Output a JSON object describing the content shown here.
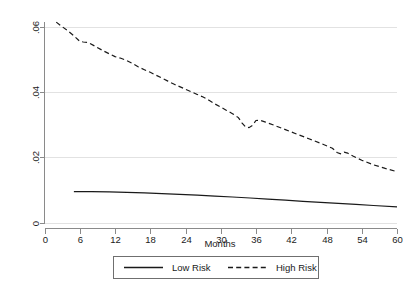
{
  "chart_data": {
    "type": "line",
    "title": "",
    "subtitle": "",
    "xlabel": "Months",
    "ylabel": "",
    "xlim": [
      0,
      60
    ],
    "ylim": [
      0,
      0.065
    ],
    "grid": true,
    "grid_orientation": "horizontal",
    "legend_position": "bottom-center",
    "background_color": "#ffffff",
    "gridline_color": "#e2e2e2",
    "axis_color": "#8a8a8a",
    "series_color": "#1a1a1a",
    "x_ticks": [
      0,
      6,
      12,
      18,
      24,
      30,
      36,
      42,
      48,
      54,
      60
    ],
    "x_tick_labels": [
      "0",
      "6",
      "12",
      "18",
      "24",
      "30",
      "36",
      "42",
      "48",
      "54",
      "60"
    ],
    "y_ticks": [
      0,
      0.02,
      0.04,
      0.06
    ],
    "y_tick_labels": [
      "0",
      ".02",
      ".04",
      ".06"
    ],
    "series": [
      {
        "name": "Low Risk",
        "style": "solid",
        "x": [
          5,
          8,
          11,
          14,
          17,
          20,
          23,
          26,
          29,
          32,
          35,
          38,
          41,
          44,
          47,
          50,
          53,
          56,
          60
        ],
        "values": [
          0.0095,
          0.00945,
          0.0094,
          0.00925,
          0.0091,
          0.00888,
          0.00865,
          0.0084,
          0.00812,
          0.00783,
          0.00752,
          0.00718,
          0.00685,
          0.0065,
          0.00618,
          0.00588,
          0.00558,
          0.00522,
          0.00482
        ]
      },
      {
        "name": "High Risk",
        "style": "dashed",
        "x": [
          2,
          3,
          4,
          5,
          6,
          6.6,
          7.5,
          8.5,
          10,
          11,
          12,
          13,
          14,
          15,
          16,
          17,
          18,
          19,
          20,
          21,
          22,
          23,
          24,
          25,
          26,
          27,
          28,
          29,
          30,
          31,
          32,
          33,
          33.6,
          34.2,
          34.8,
          35.4,
          36,
          36.6,
          37.5,
          39,
          41,
          43,
          45,
          47,
          49,
          49.8,
          50.4,
          51,
          51.6,
          52.5,
          54,
          56,
          58,
          60
        ],
        "values": [
          0.0615,
          0.0601,
          0.0588,
          0.0573,
          0.0556,
          0.0554,
          0.0552,
          0.0542,
          0.0527,
          0.0518,
          0.0509,
          0.0504,
          0.0497,
          0.0488,
          0.0477,
          0.0469,
          0.0461,
          0.0452,
          0.0443,
          0.0434,
          0.0425,
          0.0417,
          0.0409,
          0.0401,
          0.0393,
          0.0385,
          0.0375,
          0.0364,
          0.0354,
          0.0344,
          0.0334,
          0.0322,
          0.0306,
          0.0294,
          0.0291,
          0.0298,
          0.0313,
          0.0314,
          0.0309,
          0.0299,
          0.0285,
          0.0271,
          0.0257,
          0.0243,
          0.0228,
          0.0215,
          0.0211,
          0.0216,
          0.0213,
          0.0204,
          0.0191,
          0.0177,
          0.0166,
          0.0156
        ]
      }
    ]
  },
  "axis": {
    "x_title": "Months"
  },
  "legend": {
    "entries": [
      {
        "label": "Low Risk",
        "style": "solid"
      },
      {
        "label": "High Risk",
        "style": "dashed"
      }
    ]
  }
}
